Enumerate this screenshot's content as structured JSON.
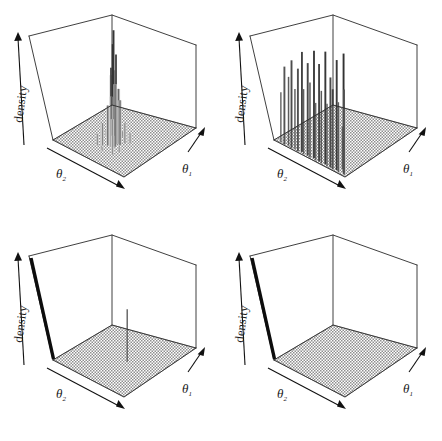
{
  "figure": {
    "title": "",
    "layout": "2x2 grid of 3D perspective density plots",
    "background_color": "#ffffff",
    "line_color": "#2a2a2a",
    "floor_color": "#b9b9b9",
    "spike_color": "#555555"
  },
  "labels": {
    "density": "density",
    "theta1_base": "θ",
    "theta1_sub": "1",
    "theta2_base": "θ",
    "theta2_sub": "2"
  },
  "panels": [
    {
      "id": "panel-top-left",
      "position": "top-left",
      "zlabel": "density",
      "xlabel": "θ1",
      "ylabel": "θ2",
      "description": "single tall concentrated peak near the centre of the theta2 side with a broad noisy skirt",
      "peak_count": 1,
      "max_height_fraction": 0.92,
      "vertical_axis_bar": false
    },
    {
      "id": "panel-top-right",
      "position": "top-right",
      "zlabel": "density",
      "xlabel": "θ1",
      "ylabel": "θ2",
      "description": "many tall spikes spread along the far theta2 wall, half the floor empty",
      "peak_count": 26,
      "max_height_fraction": 0.95,
      "vertical_axis_bar": false
    },
    {
      "id": "panel-bottom-left",
      "position": "bottom-left",
      "zlabel": "density",
      "xlabel": "θ1",
      "ylabel": "θ2",
      "description": "flat floor with one thin vertical spike in the front-centre and a thick black bar on the density axis",
      "peak_count": 1,
      "max_height_fraction": 0.42,
      "vertical_axis_bar": true
    },
    {
      "id": "panel-bottom-right",
      "position": "bottom-right",
      "zlabel": "density",
      "xlabel": "θ1",
      "ylabel": "θ2",
      "description": "entirely flat floor with a thick black bar on the density axis only",
      "peak_count": 0,
      "max_height_fraction": 0.0,
      "vertical_axis_bar": true
    }
  ],
  "chart_data": {
    "type": "bar",
    "subtype": "3d-perspective-spike-density",
    "title": "",
    "xlabel": "θ1",
    "ylabel": "θ2",
    "zlabel": "density",
    "grid": false,
    "legend": null,
    "axis_ranges": {
      "x": [
        0,
        1
      ],
      "y": [
        0,
        1
      ],
      "z": [
        0,
        1
      ]
    },
    "panels": [
      {
        "name": "panel-top-left",
        "spikes": [
          {
            "x": 0.4,
            "y": 0.52,
            "h": 0.92
          },
          {
            "x": 0.41,
            "y": 0.5,
            "h": 0.8
          },
          {
            "x": 0.43,
            "y": 0.53,
            "h": 0.72
          },
          {
            "x": 0.38,
            "y": 0.5,
            "h": 0.62
          },
          {
            "x": 0.44,
            "y": 0.49,
            "h": 0.58
          },
          {
            "x": 0.42,
            "y": 0.47,
            "h": 0.54
          },
          {
            "x": 0.39,
            "y": 0.55,
            "h": 0.5
          },
          {
            "x": 0.46,
            "y": 0.54,
            "h": 0.44
          },
          {
            "x": 0.36,
            "y": 0.52,
            "h": 0.4
          },
          {
            "x": 0.45,
            "y": 0.57,
            "h": 0.36
          },
          {
            "x": 0.35,
            "y": 0.48,
            "h": 0.32
          },
          {
            "x": 0.48,
            "y": 0.51,
            "h": 0.28
          },
          {
            "x": 0.33,
            "y": 0.56,
            "h": 0.24
          },
          {
            "x": 0.5,
            "y": 0.46,
            "h": 0.22
          },
          {
            "x": 0.31,
            "y": 0.44,
            "h": 0.18
          },
          {
            "x": 0.52,
            "y": 0.58,
            "h": 0.16
          },
          {
            "x": 0.29,
            "y": 0.6,
            "h": 0.13
          },
          {
            "x": 0.54,
            "y": 0.42,
            "h": 0.11
          },
          {
            "x": 0.27,
            "y": 0.4,
            "h": 0.09
          },
          {
            "x": 0.56,
            "y": 0.62,
            "h": 0.08
          },
          {
            "x": 0.25,
            "y": 0.63,
            "h": 0.06
          },
          {
            "x": 0.58,
            "y": 0.38,
            "h": 0.05
          },
          {
            "x": 0.47,
            "y": 0.36,
            "h": 0.05
          },
          {
            "x": 0.34,
            "y": 0.65,
            "h": 0.04
          },
          {
            "x": 0.6,
            "y": 0.48,
            "h": 0.04
          },
          {
            "x": 0.23,
            "y": 0.5,
            "h": 0.03
          }
        ]
      },
      {
        "name": "panel-top-right",
        "spikes": [
          {
            "x": 0.02,
            "y": 0.08,
            "h": 0.4
          },
          {
            "x": 0.02,
            "y": 0.13,
            "h": 0.62
          },
          {
            "x": 0.03,
            "y": 0.18,
            "h": 0.55
          },
          {
            "x": 0.02,
            "y": 0.23,
            "h": 0.7
          },
          {
            "x": 0.03,
            "y": 0.27,
            "h": 0.48
          },
          {
            "x": 0.02,
            "y": 0.32,
            "h": 0.66
          },
          {
            "x": 0.04,
            "y": 0.36,
            "h": 0.8
          },
          {
            "x": 0.02,
            "y": 0.4,
            "h": 0.52
          },
          {
            "x": 0.03,
            "y": 0.45,
            "h": 0.74
          },
          {
            "x": 0.02,
            "y": 0.49,
            "h": 0.6
          },
          {
            "x": 0.04,
            "y": 0.53,
            "h": 0.86
          },
          {
            "x": 0.02,
            "y": 0.57,
            "h": 0.46
          },
          {
            "x": 0.03,
            "y": 0.61,
            "h": 0.78
          },
          {
            "x": 0.02,
            "y": 0.65,
            "h": 0.58
          },
          {
            "x": 0.04,
            "y": 0.69,
            "h": 0.9
          },
          {
            "x": 0.02,
            "y": 0.73,
            "h": 0.5
          },
          {
            "x": 0.03,
            "y": 0.77,
            "h": 0.72
          },
          {
            "x": 0.02,
            "y": 0.81,
            "h": 0.64
          },
          {
            "x": 0.04,
            "y": 0.85,
            "h": 0.88
          },
          {
            "x": 0.02,
            "y": 0.89,
            "h": 0.56
          },
          {
            "x": 0.06,
            "y": 0.93,
            "h": 0.95
          },
          {
            "x": 0.03,
            "y": 0.96,
            "h": 0.68
          },
          {
            "x": 0.08,
            "y": 0.6,
            "h": 0.3
          },
          {
            "x": 0.09,
            "y": 0.75,
            "h": 0.26
          },
          {
            "x": 0.07,
            "y": 0.35,
            "h": 0.22
          },
          {
            "x": 0.1,
            "y": 0.88,
            "h": 0.34
          }
        ]
      },
      {
        "name": "panel-bottom-left",
        "spikes": [
          {
            "x": 0.56,
            "y": 0.58,
            "h": 0.42
          }
        ]
      },
      {
        "name": "panel-bottom-right",
        "spikes": []
      }
    ]
  }
}
